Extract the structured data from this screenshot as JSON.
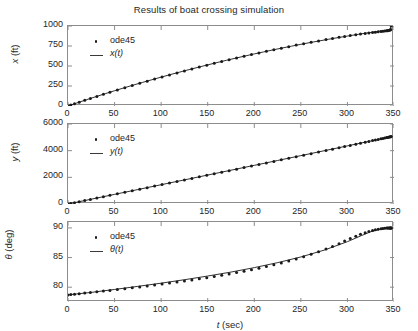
{
  "figure": {
    "title": "Results of boat crossing simulation",
    "background": "#ffffff",
    "axis_color": "#8d8d8d",
    "data_color": "#1a1a1a",
    "width": 418,
    "height": 331
  },
  "xlabel": {
    "symbol": "t",
    "unit": " (sec)"
  },
  "legend": {
    "marker_label": "ode45",
    "entries": [
      "x(t)",
      "y(t)",
      "θ(t)"
    ]
  },
  "chart_data": [
    {
      "type": "line",
      "id": "x-vs-t",
      "title": "Results of boat crossing simulation",
      "xlabel": "t (sec)",
      "ylabel": "x (ft)",
      "ylabel_symbol": "x",
      "ylabel_unit": " (ft)",
      "xlim": [
        0,
        350
      ],
      "ylim": [
        0,
        1000
      ],
      "xticks": [
        0,
        50,
        100,
        150,
        200,
        250,
        300,
        350
      ],
      "yticks": [
        0,
        250,
        500,
        750,
        1000
      ],
      "grid": false,
      "legend_position": "upper-left",
      "series": [
        {
          "name": "ode45",
          "style": "markers",
          "marker": "dot",
          "x": [
            0,
            3,
            7,
            12,
            18,
            24,
            31,
            38,
            45,
            53,
            61,
            69,
            77,
            85,
            93,
            101,
            109,
            117,
            125,
            133,
            141,
            149,
            157,
            165,
            173,
            181,
            189,
            197,
            205,
            213,
            221,
            229,
            237,
            245,
            253,
            261,
            269,
            277,
            284,
            291,
            297,
            303,
            309,
            314,
            319,
            323,
            327,
            330,
            333,
            336,
            338,
            340,
            342,
            343,
            344,
            345,
            346,
            346.5,
            347
          ],
          "y": [
            0,
            12,
            28,
            48,
            71,
            94,
            120,
            146,
            171,
            200,
            228,
            256,
            283,
            310,
            336,
            362,
            388,
            413,
            438,
            462,
            486,
            510,
            533,
            556,
            578,
            600,
            622,
            643,
            664,
            684,
            704,
            723,
            742,
            761,
            779,
            797,
            814,
            831,
            845,
            859,
            870,
            881,
            891,
            899,
            907,
            913,
            919,
            923,
            927,
            931,
            934,
            937,
            940,
            942,
            944,
            947,
            951,
            956,
            1000
          ]
        },
        {
          "name": "x(t)",
          "style": "line",
          "x": [
            0,
            10,
            20,
            30,
            40,
            50,
            60,
            70,
            80,
            90,
            100,
            110,
            120,
            130,
            140,
            150,
            160,
            170,
            180,
            190,
            200,
            210,
            220,
            230,
            240,
            250,
            260,
            270,
            280,
            290,
            300,
            310,
            320,
            330,
            335,
            340,
            343,
            345,
            346,
            347
          ],
          "y": [
            0,
            40,
            79,
            117,
            154,
            191,
            226,
            261,
            295,
            328,
            361,
            393,
            424,
            455,
            485,
            514,
            543,
            571,
            598,
            625,
            651,
            676,
            701,
            725,
            748,
            771,
            793,
            814,
            835,
            855,
            874,
            893,
            911,
            928,
            936,
            944,
            950,
            957,
            970,
            1000
          ]
        }
      ]
    },
    {
      "type": "line",
      "id": "y-vs-t",
      "xlabel": "t (sec)",
      "ylabel": "y (ft)",
      "ylabel_symbol": "y",
      "ylabel_unit": " (ft)",
      "xlim": [
        0,
        350
      ],
      "ylim": [
        0,
        6000
      ],
      "xticks": [
        0,
        50,
        100,
        150,
        200,
        250,
        300,
        350
      ],
      "yticks": [
        0,
        2000,
        4000,
        6000
      ],
      "grid": false,
      "legend_position": "upper-left",
      "series": [
        {
          "name": "ode45",
          "style": "markers",
          "marker": "dot",
          "x": [
            0,
            3,
            7,
            12,
            18,
            24,
            31,
            38,
            45,
            53,
            61,
            69,
            77,
            85,
            93,
            101,
            109,
            117,
            125,
            133,
            141,
            149,
            157,
            165,
            173,
            181,
            189,
            197,
            205,
            213,
            221,
            229,
            237,
            245,
            253,
            261,
            269,
            277,
            284,
            291,
            297,
            303,
            309,
            314,
            319,
            323,
            327,
            330,
            333,
            336,
            338,
            340,
            342,
            343,
            344,
            345,
            346,
            346.5,
            347
          ],
          "y": [
            0,
            43,
            101,
            173,
            259,
            346,
            447,
            548,
            649,
            764,
            880,
            995,
            1110,
            1226,
            1341,
            1457,
            1572,
            1688,
            1803,
            1919,
            2035,
            2150,
            2266,
            2382,
            2498,
            2614,
            2730,
            2846,
            2962,
            3078,
            3194,
            3311,
            3427,
            3544,
            3661,
            3778,
            3895,
            4012,
            4115,
            4218,
            4307,
            4396,
            4485,
            4560,
            4635,
            4695,
            4755,
            4800,
            4845,
            4890,
            4920,
            4950,
            4980,
            4995,
            5010,
            5025,
            5040,
            5048,
            5055
          ]
        },
        {
          "name": "y(t)",
          "style": "line",
          "x": [
            0,
            25,
            50,
            75,
            100,
            125,
            150,
            175,
            200,
            225,
            250,
            275,
            300,
            325,
            347
          ],
          "y": [
            0,
            361,
            722,
            1084,
            1446,
            1809,
            2172,
            2535,
            2899,
            3263,
            3628,
            3993,
            4358,
            4724,
            5055
          ]
        }
      ]
    },
    {
      "type": "line",
      "id": "theta-vs-t",
      "xlabel": "t (sec)",
      "ylabel": "θ (deg)",
      "ylabel_symbol": "θ",
      "ylabel_unit": " (deg)",
      "xlim": [
        0,
        350
      ],
      "ylim": [
        77.5,
        91
      ],
      "xticks": [
        0,
        50,
        100,
        150,
        200,
        250,
        300,
        350
      ],
      "yticks": [
        80,
        85,
        90
      ],
      "grid": false,
      "legend_position": "upper-left",
      "series": [
        {
          "name": "ode45",
          "style": "markers",
          "marker": "dot",
          "x": [
            0,
            3,
            7,
            12,
            18,
            24,
            31,
            38,
            45,
            53,
            61,
            69,
            77,
            85,
            93,
            101,
            109,
            117,
            125,
            133,
            141,
            149,
            157,
            165,
            173,
            181,
            189,
            197,
            205,
            213,
            221,
            229,
            237,
            245,
            253,
            261,
            269,
            277,
            284,
            291,
            297,
            303,
            309,
            314,
            319,
            323,
            327,
            330,
            333,
            336,
            338,
            340,
            342,
            343,
            344,
            345,
            345.6,
            346.1,
            346.5,
            346.8,
            347
          ],
          "y": [
            78.7,
            78.75,
            78.82,
            78.9,
            79.0,
            79.1,
            79.22,
            79.34,
            79.46,
            79.6,
            79.75,
            79.9,
            80.05,
            80.2,
            80.36,
            80.52,
            80.69,
            80.86,
            81.04,
            81.22,
            81.41,
            81.6,
            81.8,
            82.01,
            82.23,
            82.46,
            82.7,
            82.95,
            83.21,
            83.49,
            83.78,
            84.09,
            84.42,
            84.77,
            85.14,
            85.54,
            85.97,
            86.44,
            86.88,
            87.35,
            87.78,
            88.2,
            88.6,
            88.92,
            89.2,
            89.4,
            89.57,
            89.68,
            89.77,
            89.85,
            89.9,
            89.94,
            89.97,
            89.98,
            89.99,
            90.0,
            90.0,
            90.0,
            90.0,
            90.0,
            90.0
          ]
        },
        {
          "name": "θ(t)",
          "style": "line",
          "x": [
            0,
            25,
            50,
            75,
            100,
            125,
            150,
            175,
            200,
            225,
            250,
            275,
            300,
            315,
            325,
            335,
            341,
            344,
            346,
            347
          ],
          "y": [
            78.7,
            79.12,
            79.62,
            80.14,
            80.68,
            81.26,
            81.88,
            82.55,
            83.3,
            84.14,
            85.1,
            86.25,
            87.68,
            88.7,
            89.35,
            89.78,
            89.93,
            89.98,
            90.0,
            90.0
          ]
        }
      ]
    }
  ]
}
